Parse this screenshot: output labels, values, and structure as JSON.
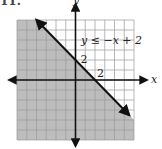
{
  "problem_label": "11.",
  "chart_data": {
    "type": "inequality-graph",
    "title": "",
    "inequality": "y ≤ −x + 2",
    "boundary_line": {
      "slope": -1,
      "intercept": 2,
      "style": "solid",
      "points": [
        [
          -4,
          6
        ],
        [
          5.5,
          -3.5
        ]
      ]
    },
    "shaded_region": "below-left of line",
    "xlabel": "x",
    "ylabel": "y",
    "xlim": [
      -6,
      6
    ],
    "ylim": [
      -6,
      6
    ],
    "grid": true,
    "grid_step": 1,
    "annotations": [
      {
        "text": "2",
        "position": "y-intercept",
        "value": [
          0,
          2
        ]
      },
      {
        "text": "2",
        "position": "x-intercept",
        "value": [
          2,
          0
        ]
      }
    ],
    "colors": {
      "shade": "#bdbdbd",
      "grid": "#9a9a9a",
      "axes": "#111111",
      "line": "#111111"
    }
  },
  "labels": {
    "inequality": "y ≤ −x + 2",
    "x_axis": "x",
    "y_axis": "y",
    "y_tick": "2",
    "x_tick": "2"
  }
}
